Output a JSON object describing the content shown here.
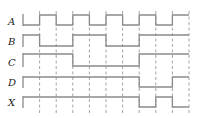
{
  "diagram": {
    "type": "timing-diagram",
    "colors": {
      "signal": "#8a8a8a",
      "grid": "#9a9a9a",
      "label": "#222222",
      "background": "#ffffff"
    },
    "layout": {
      "x_start": 23,
      "x_end": 189,
      "intervals": 10,
      "grid_top": 11,
      "grid_bottom": 113,
      "label_x": 8
    },
    "signals": [
      {
        "name": "A",
        "high_y": 15,
        "low_y": 25,
        "label_y": 25,
        "levels": [
          0,
          1,
          0,
          1,
          0,
          1,
          0,
          1,
          0,
          1
        ]
      },
      {
        "name": "B",
        "high_y": 35,
        "low_y": 46,
        "label_y": 45,
        "levels": [
          1,
          0,
          0,
          1,
          1,
          0,
          0,
          1,
          1,
          1
        ]
      },
      {
        "name": "C",
        "high_y": 54,
        "low_y": 66,
        "label_y": 66,
        "levels": [
          1,
          1,
          1,
          0,
          0,
          0,
          0,
          1,
          1,
          1
        ]
      },
      {
        "name": "D",
        "high_y": 77,
        "low_y": 87,
        "label_y": 86,
        "levels": [
          1,
          1,
          1,
          1,
          1,
          1,
          1,
          0,
          0,
          1
        ]
      },
      {
        "name": "X",
        "high_y": 97,
        "low_y": 107,
        "label_y": 106,
        "levels": [
          1,
          1,
          1,
          1,
          1,
          1,
          1,
          0,
          1,
          0
        ]
      }
    ]
  }
}
